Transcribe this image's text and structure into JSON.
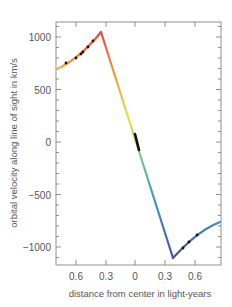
{
  "chart_data": {
    "type": "line",
    "title": "",
    "xlabel": "distance from center in light-years",
    "ylabel": "orbital velocity along line of sight in km/s",
    "xlim": [
      -0.8,
      0.8
    ],
    "ylim": [
      -1180,
      1180
    ],
    "x_ticks": [
      -0.6,
      -0.3,
      0,
      0.3,
      0.6
    ],
    "x_tick_labels": [
      "0.6",
      "0.3",
      "0",
      "0.3",
      "0.6"
    ],
    "y_ticks": [
      1000,
      500,
      0,
      -500,
      -1000
    ],
    "y_tick_labels": [
      "1000",
      "500",
      "0",
      "−500",
      "−1000"
    ],
    "grid": false,
    "legend": null,
    "series": [
      {
        "name": "model rotation curve",
        "style": "color-gradient line (orange-red to yellow, green, blue, purple)",
        "x": [
          -0.78,
          -0.7,
          -0.6,
          -0.5,
          -0.42,
          -0.35,
          -0.3,
          -0.2,
          -0.1,
          0.0,
          0.1,
          0.2,
          0.3,
          0.37,
          0.45,
          0.55,
          0.65,
          0.78
        ],
        "y": [
          700,
          740,
          800,
          870,
          950,
          1050,
          960,
          700,
          390,
          60,
          -250,
          -560,
          -870,
          -1100,
          -1000,
          -900,
          -840,
          -760
        ]
      },
      {
        "name": "observed data points",
        "style": "black dots",
        "x": [
          -0.69,
          -0.56,
          -0.5,
          -0.47,
          -0.41,
          -0.37,
          0.02,
          0.04,
          0.46,
          0.52,
          0.58
        ],
        "y": [
          745,
          805,
          850,
          880,
          930,
          985,
          20,
          -50,
          -990,
          -935,
          -880
        ]
      }
    ],
    "colors": {
      "peak": "#e8463a",
      "left_start": "#f2a23a",
      "mid_yellow": "#e6e23c",
      "zero_green": "#8fcf6a",
      "teal": "#3aa7b8",
      "trough": "#5a4a9a",
      "right_end": "#3a8fd0",
      "points": "#111111",
      "axes": "#777777"
    }
  }
}
